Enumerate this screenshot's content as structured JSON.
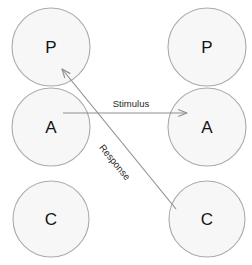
{
  "diagram": {
    "colors": {
      "node_fill": "#f7f7f7",
      "node_stroke": "#ababab",
      "edge_stroke": "#8f8f8f",
      "node_text": "#141414",
      "edge_text": "#1f1f1f",
      "background": "#ffffff"
    },
    "nodes": [
      {
        "id": "left-p",
        "label": "P",
        "cx": 51,
        "cy": 47,
        "r": 39,
        "column": "left",
        "row": "parent"
      },
      {
        "id": "left-a",
        "label": "A",
        "cx": 51,
        "cy": 127,
        "r": 39,
        "column": "left",
        "row": "adult"
      },
      {
        "id": "left-c",
        "label": "C",
        "cx": 51,
        "cy": 219,
        "r": 38,
        "column": "left",
        "row": "child"
      },
      {
        "id": "right-p",
        "label": "P",
        "cx": 207,
        "cy": 47,
        "r": 39,
        "column": "right",
        "row": "parent"
      },
      {
        "id": "right-a",
        "label": "A",
        "cx": 207,
        "cy": 127,
        "r": 39,
        "column": "right",
        "row": "adult"
      },
      {
        "id": "right-c",
        "label": "C",
        "cx": 207,
        "cy": 219,
        "r": 38,
        "column": "right",
        "row": "child"
      }
    ],
    "edges": [
      {
        "id": "stimulus",
        "label": "Stimulus",
        "from": "left-a",
        "to": "right-a",
        "x1": 63,
        "y1": 113,
        "x2": 187,
        "y2": 113,
        "label_x": 131,
        "label_y": 103,
        "label_rotation": 0
      },
      {
        "id": "response",
        "label": "Response",
        "from": "right-c",
        "to": "left-p",
        "x1": 176,
        "y1": 209,
        "x2": 62,
        "y2": 69,
        "label_x": 115,
        "label_y": 162,
        "label_rotation": 50.8
      }
    ]
  }
}
